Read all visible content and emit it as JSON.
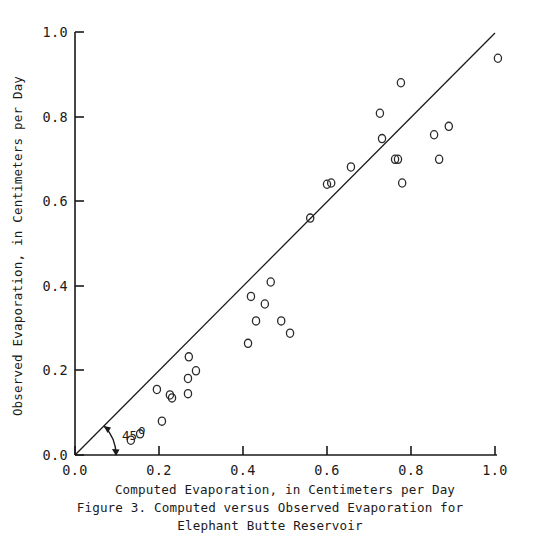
{
  "chart_data": {
    "type": "scatter",
    "title": "Figure 3.  Computed versus Observed Evaporation for",
    "title_line2": "Elephant Butte Reservoir",
    "xlabel": "Computed Evaporation, in Centimeters per Day",
    "ylabel": "Observed Evaporation, in Centimeters per Day",
    "xlim": [
      0.0,
      1.0
    ],
    "ylim": [
      0.0,
      1.0
    ],
    "grid": false,
    "legend": null,
    "xticks": [
      "0.0",
      "0.2",
      "0.4",
      "0.6",
      "0.8",
      "1.0"
    ],
    "yticks": [
      "0.0",
      "0.2",
      "0.4",
      "0.6",
      "0.8",
      "1.0"
    ],
    "xtick_values": [
      0.0,
      0.2,
      0.4,
      0.6,
      0.8,
      1.0
    ],
    "ytick_values": [
      0.0,
      0.2,
      0.4,
      0.6,
      0.8,
      1.0
    ],
    "annotations": [
      {
        "text": "45",
        "superscript": "o",
        "meaning": "45-degree line angle at origin"
      }
    ],
    "reference_line": {
      "label": "45-degree 1:1 line",
      "from": [
        0.0,
        0.0
      ],
      "to": [
        1.0,
        1.0
      ]
    },
    "marker_style": "open circle",
    "x": [
      0.133,
      0.155,
      0.207,
      0.195,
      0.231,
      0.226,
      0.269,
      0.288,
      0.269,
      0.271,
      0.412,
      0.419,
      0.431,
      0.466,
      0.452,
      0.491,
      0.512,
      0.56,
      0.6,
      0.61,
      0.657,
      0.726,
      0.731,
      0.776,
      0.762,
      0.779,
      0.769,
      0.855,
      0.867,
      0.89,
      1.007
    ],
    "y": [
      0.035,
      0.05,
      0.08,
      0.155,
      0.135,
      0.142,
      0.145,
      0.199,
      0.181,
      0.232,
      0.264,
      0.375,
      0.317,
      0.409,
      0.357,
      0.317,
      0.288,
      0.56,
      0.64,
      0.643,
      0.681,
      0.808,
      0.748,
      0.88,
      0.699,
      0.643,
      0.699,
      0.757,
      0.699,
      0.777,
      0.938
    ],
    "points": [
      [
        0.133,
        0.035
      ],
      [
        0.155,
        0.05
      ],
      [
        0.207,
        0.08
      ],
      [
        0.195,
        0.155
      ],
      [
        0.231,
        0.135
      ],
      [
        0.226,
        0.142
      ],
      [
        0.269,
        0.145
      ],
      [
        0.288,
        0.199
      ],
      [
        0.269,
        0.181
      ],
      [
        0.271,
        0.232
      ],
      [
        0.412,
        0.264
      ],
      [
        0.419,
        0.375
      ],
      [
        0.431,
        0.317
      ],
      [
        0.466,
        0.409
      ],
      [
        0.452,
        0.357
      ],
      [
        0.491,
        0.317
      ],
      [
        0.512,
        0.288
      ],
      [
        0.56,
        0.56
      ],
      [
        0.6,
        0.64
      ],
      [
        0.61,
        0.643
      ],
      [
        0.657,
        0.681
      ],
      [
        0.726,
        0.808
      ],
      [
        0.731,
        0.748
      ],
      [
        0.776,
        0.88
      ],
      [
        0.762,
        0.699
      ],
      [
        0.779,
        0.643
      ],
      [
        0.769,
        0.699
      ],
      [
        0.855,
        0.757
      ],
      [
        0.867,
        0.699
      ],
      [
        0.89,
        0.777
      ],
      [
        1.007,
        0.938
      ]
    ]
  },
  "figure": {
    "caption_line1": "Figure 3.  Computed versus Observed Evaporation for",
    "caption_line2": "Elephant Butte Reservoir",
    "angle_text": "45",
    "angle_degree_symbol": "o"
  }
}
